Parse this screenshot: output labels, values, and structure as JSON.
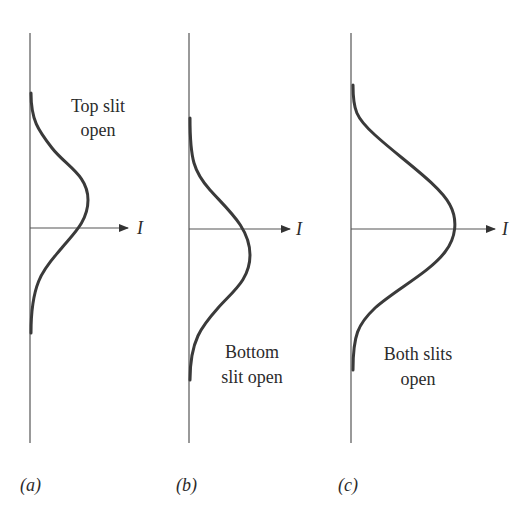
{
  "figure": {
    "axis_label": "I",
    "panels": [
      {
        "id": "a",
        "caption": "(a)",
        "description_lines": [
          "Top slit",
          "open"
        ]
      },
      {
        "id": "b",
        "caption": "(b)",
        "description_lines": [
          "Bottom",
          "slit open"
        ]
      },
      {
        "id": "c",
        "caption": "(c)",
        "description_lines": [
          "Both slits",
          "open"
        ]
      }
    ]
  }
}
